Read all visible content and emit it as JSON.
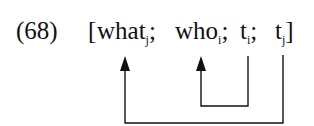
{
  "example": {
    "number_label": "(68)",
    "open_bracket": "[",
    "items": [
      {
        "word": "what",
        "index": "j",
        "sep": ";"
      },
      {
        "word": "who",
        "index": "i",
        "sep": ";"
      },
      {
        "word": "t",
        "index": "i",
        "sep": ";"
      },
      {
        "word": "t",
        "index": "j",
        "sep": ""
      }
    ],
    "close_bracket": "]"
  },
  "arrows": [
    {
      "from": "t_i",
      "to": "who_i",
      "label": "movement-arrow-i"
    },
    {
      "from": "t_j",
      "to": "what_j",
      "label": "movement-arrow-j"
    }
  ],
  "colors": {
    "ink": "#111111",
    "background": "#ffffff"
  }
}
